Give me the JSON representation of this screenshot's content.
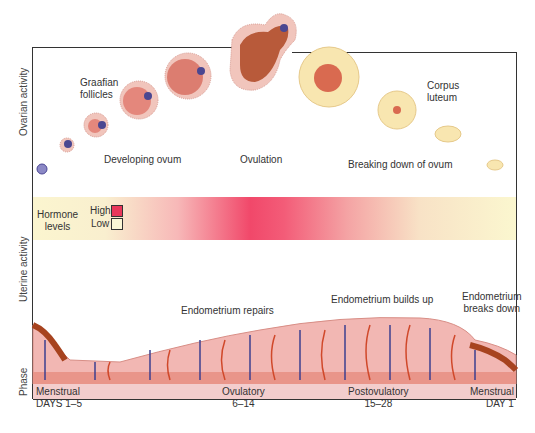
{
  "axes": {
    "ovarian": "Ovarian activity",
    "uterine": "Uterine activity",
    "phase": "Phase"
  },
  "ovarian": {
    "graafian": [
      "Graafian",
      "follicles"
    ],
    "developing": "Developing ovum",
    "ovulation": "Ovulation",
    "breaking": "Breaking down of ovum",
    "corpus": [
      "Corpus",
      "luteum"
    ]
  },
  "hormone": {
    "label": [
      "Hormone",
      "levels"
    ],
    "high": "High",
    "low": "Low",
    "high_color": "#e8365a",
    "low_color": "#fbf7d6"
  },
  "uterine": {
    "repairs": "Endometrium repairs",
    "builds": "Endometrium builds up",
    "breaks": [
      "Endometrium",
      "breaks down"
    ]
  },
  "phases": [
    {
      "name": "Menstrual",
      "days": "DAYS 1–5"
    },
    {
      "name": "Ovulatory",
      "days": "6–14"
    },
    {
      "name": "Postovulatory",
      "days": "15–28"
    },
    {
      "name": "Menstrual",
      "days": "DAY 1"
    }
  ],
  "colors": {
    "tissue": "#f2b7b3",
    "vein": "#3d3f8f",
    "artery": "#d0482a",
    "menses": "#a7431f",
    "follicle": "#e79a8a",
    "corpus": "#f7e3a6"
  }
}
